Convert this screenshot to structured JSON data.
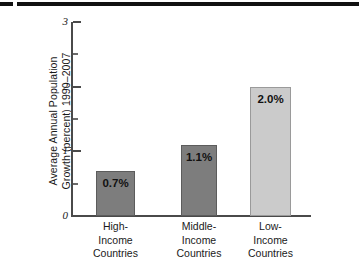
{
  "figure": {
    "has_top_rule": true,
    "rule_color": "#111111"
  },
  "chart_data": {
    "type": "bar",
    "title": "",
    "xlabel": "",
    "ylabel": "Average Annual Population\nGrowth (percent) 1990–2007",
    "categories": [
      "High-\nIncome\nCountries",
      "Middle-\nIncome\nCountries",
      "Low-\nIncome\nCountries"
    ],
    "category_lines": [
      [
        "High-",
        "Income",
        "Countries"
      ],
      [
        "Middle-",
        "Income",
        "Countries"
      ],
      [
        "Low-",
        "Income",
        "Countries"
      ]
    ],
    "values": [
      0.7,
      1.1,
      2.0
    ],
    "value_labels": [
      "0.7%",
      "1.1%",
      "2.0%"
    ],
    "bar_colors": [
      "#7d7d7d",
      "#7d7d7d",
      "#cbcbcb"
    ],
    "bar_border_colors": [
      "#5c5c5c",
      "#5c5c5c",
      "#9a9a9a"
    ],
    "ylim": [
      0,
      3
    ],
    "yticks": [
      0,
      1,
      2,
      3
    ],
    "ytick_labels": [
      "0",
      "1",
      "2",
      "3"
    ],
    "yticks_minor": [
      0.5,
      1.5,
      2.5
    ],
    "grid": false,
    "legend": null
  },
  "axis": {
    "line_color": "#4a4a4a"
  }
}
